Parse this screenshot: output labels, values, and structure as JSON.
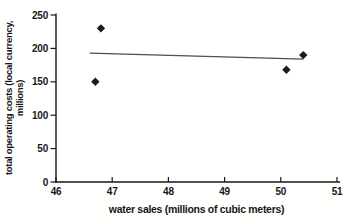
{
  "figure": {
    "background": "#fffffe",
    "ink_color": "#171717",
    "marker_color": "#1c1c1c",
    "trend_color": "#4f4f4f"
  },
  "chart_data": {
    "type": "scatter",
    "title": "",
    "xlabel": "water sales (millions of cubic meters)",
    "ylabel_line1": "total operating costs (local currency,",
    "ylabel_line2": "millions)",
    "xlim": [
      46,
      51
    ],
    "ylim": [
      0,
      250
    ],
    "x_ticks": [
      46,
      47,
      48,
      49,
      50,
      51
    ],
    "y_ticks": [
      0,
      50,
      100,
      150,
      200,
      250
    ],
    "grid": false,
    "marker": "diamond",
    "points": [
      {
        "x": 46.8,
        "y": 230
      },
      {
        "x": 46.7,
        "y": 150
      },
      {
        "x": 50.1,
        "y": 168
      },
      {
        "x": 50.4,
        "y": 190
      }
    ],
    "trendline": {
      "x1": 46.6,
      "y1": 193,
      "x2": 50.4,
      "y2": 184
    }
  }
}
